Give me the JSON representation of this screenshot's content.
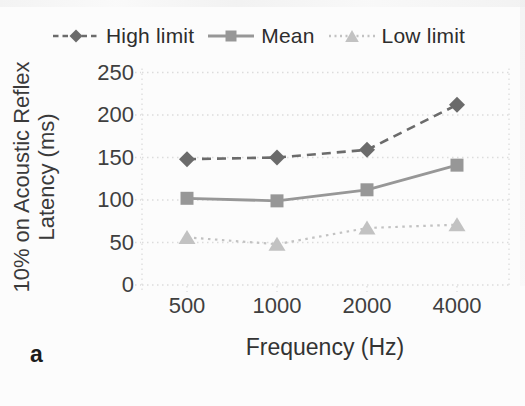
{
  "figure_label": "a",
  "chart_data": {
    "type": "line",
    "title": "",
    "xlabel": "Frequency (Hz)",
    "ylabel": "10% on Acoustic Reflex Latency (ms)",
    "categories": [
      "500",
      "1000",
      "2000",
      "4000"
    ],
    "x_values_hz": [
      500,
      1000,
      2000,
      4000
    ],
    "yticks": [
      0,
      50,
      100,
      150,
      200,
      250
    ],
    "ylim": [
      0,
      250
    ],
    "grid": "horizontal-dotted",
    "legend_position": "top-center",
    "series": [
      {
        "name": "High limit",
        "values": [
          148,
          150,
          159,
          212
        ],
        "color": "#6b6b6b",
        "line_style": "dashed",
        "marker": "diamond"
      },
      {
        "name": "Mean",
        "values": [
          102,
          99,
          112,
          141
        ],
        "color": "#979797",
        "line_style": "solid",
        "marker": "square"
      },
      {
        "name": "Low limit",
        "values": [
          56,
          48,
          67,
          71
        ],
        "color": "#c2c2c2",
        "line_style": "dotted",
        "marker": "triangle"
      }
    ],
    "colors": {
      "grid": "#dcdcdc",
      "axis": "#d6d6d6",
      "text": "#3f3f3f",
      "background": "#fcfcfc"
    }
  }
}
